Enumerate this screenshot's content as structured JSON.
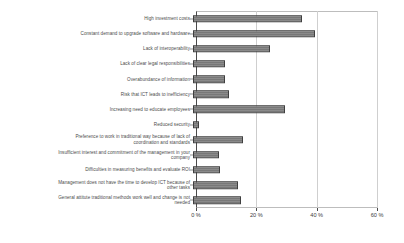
{
  "chart_data": {
    "type": "bar",
    "orientation": "horizontal",
    "title": "",
    "xlabel": "",
    "ylabel": "",
    "xlim": [
      0,
      60
    ],
    "grid": true,
    "legend": "none",
    "xticks": [
      "0 %",
      "20 %",
      "40 %",
      "60 %"
    ],
    "xtick_values": [
      0,
      20,
      40,
      60
    ],
    "categories": [
      "High investment costs",
      "Constant demand to upgrade software and hardware",
      "Lack of interoperability",
      "Lack of clear legal responsibilities",
      "Overabundance of information",
      "Risk that ICT leads to inefficiency",
      "Increasing need to educate employees",
      "Reduced security",
      "Preference to work in traditional way because of lack of\ncoordination and standards",
      "Insufficient interest and commitment of the management in your\ncompany",
      "Difficulties in measuring benefits and evaluate ROI",
      "Management does not have the time to develop ICT because of\nother tasks",
      "General attitute traditional methods work well and change is not\nneeded"
    ],
    "values": [
      36,
      40.5,
      25.5,
      10.5,
      10.5,
      12,
      30.5,
      2,
      16.5,
      8.5,
      9,
      15,
      16
    ],
    "unit": "%",
    "colors": {
      "bar_fill": "#808080",
      "bar_border": "#3f3f3f",
      "gridline": "#cfcfcf",
      "axis": "#4a4a4a",
      "text": "#4c4c4c",
      "background": "#ffffff"
    }
  }
}
